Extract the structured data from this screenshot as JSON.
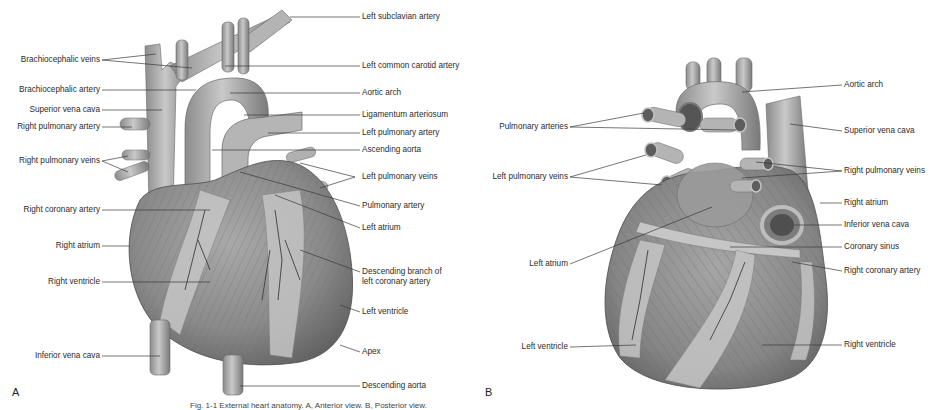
{
  "figure": {
    "panels": [
      {
        "letter": "A",
        "view": "anterior",
        "labels_left": [
          "Brachiocephalic veins",
          "Brachiocephalic artery",
          "Superior vena cava",
          "Right pulmonary artery",
          "Right pulmonary veins",
          "Right coronary artery",
          "Right atrium",
          "Right ventricle",
          "Inferior vena cava"
        ],
        "labels_right": [
          "Left subclavian artery",
          "Left common carotid artery",
          "Aortic arch",
          "Ligamentum arteriosum",
          "Left pulmonary artery",
          "Ascending aorta",
          "Left pulmonary veins",
          "Pulmonary artery",
          "Left atrium",
          "Descending branch of",
          "left coronary artery",
          "Left ventricle",
          "Apex",
          "Descending aorta"
        ]
      },
      {
        "letter": "B",
        "view": "posterior",
        "labels_left": [
          "Pulmonary arteries",
          "Left pulmonary veins",
          "Left atrium",
          "Left ventricle"
        ],
        "labels_right": [
          "Aortic arch",
          "Superior vena cava",
          "Right pulmonary veins",
          "Right atrium",
          "Inferior vena cava",
          "Coronary sinus",
          "Right coronary artery",
          "Right ventricle"
        ]
      }
    ],
    "caption": "Fig. 1-1 External heart anatomy. A, Anterior view. B, Posterior view."
  }
}
